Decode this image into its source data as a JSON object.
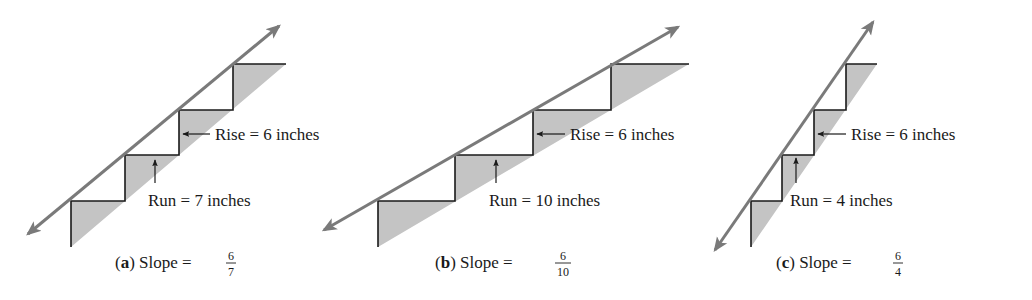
{
  "colors": {
    "background": "#ffffff",
    "step_line": "#1a1a1a",
    "slope_line": "#7a7a7a",
    "shading": "#c4c4c4",
    "text": "#1a1a1a"
  },
  "units": "inches",
  "panels": [
    {
      "id": "a",
      "letter": "a",
      "caption_prefix": "Slope =",
      "rise_label": "Rise = 6 inches",
      "run_label": "Run = 7 inches",
      "rise": 6,
      "run": 7,
      "slope": {
        "numerator": "6",
        "denominator": "7"
      },
      "geometry": {
        "verticals_x": [
          71,
          125,
          179,
          233
        ],
        "treads_y": [
          201,
          155,
          110,
          64
        ],
        "bottom_y": 247,
        "top_end_x": 286,
        "arrow_start": [
          28,
          234
        ],
        "arrow_end": [
          279,
          26
        ],
        "rise_arrow": {
          "x1": 210,
          "x2": 183,
          "y": 134
        },
        "run_arrow": {
          "x": 155,
          "y1": 183,
          "y2": 160
        },
        "rise_text": [
          215,
          140
        ],
        "run_text": [
          148,
          206
        ],
        "caption": [
          115,
          268
        ],
        "frac_x": 231
      }
    },
    {
      "id": "b",
      "letter": "b",
      "caption_prefix": "Slope =",
      "rise_label": "Rise = 6 inches",
      "run_label": "Run = 10 inches",
      "rise": 6,
      "run": 10,
      "slope": {
        "numerator": "6",
        "denominator": "10"
      },
      "geometry": {
        "verticals_x": [
          378,
          455,
          533,
          611
        ],
        "treads_y": [
          201,
          155,
          110,
          64
        ],
        "bottom_y": 247,
        "top_end_x": 689,
        "arrow_start": [
          324,
          230
        ],
        "arrow_end": [
          678,
          27
        ],
        "rise_arrow": {
          "x1": 565,
          "x2": 537,
          "y": 134
        },
        "run_arrow": {
          "x": 496,
          "y1": 183,
          "y2": 160
        },
        "rise_text": [
          570,
          140
        ],
        "run_text": [
          489,
          206
        ],
        "caption": [
          435,
          268
        ],
        "frac_x": 563
      }
    },
    {
      "id": "c",
      "letter": "c",
      "caption_prefix": "Slope =",
      "rise_label": "Rise = 6 inches",
      "run_label": "Run = 4 inches",
      "rise": 6,
      "run": 4,
      "slope": {
        "numerator": "6",
        "denominator": "4"
      },
      "geometry": {
        "verticals_x": [
          751,
          782,
          814,
          846
        ],
        "treads_y": [
          201,
          155,
          110,
          64
        ],
        "bottom_y": 247,
        "top_end_x": 877,
        "arrow_start": [
          715,
          250
        ],
        "arrow_end": [
          873,
          22
        ],
        "rise_arrow": {
          "x1": 846,
          "x2": 818,
          "y": 134
        },
        "run_arrow": {
          "x": 796,
          "y1": 183,
          "y2": 158
        },
        "rise_text": [
          851,
          140
        ],
        "run_text": [
          790,
          206
        ],
        "caption": [
          776,
          268
        ],
        "frac_x": 898
      }
    }
  ]
}
